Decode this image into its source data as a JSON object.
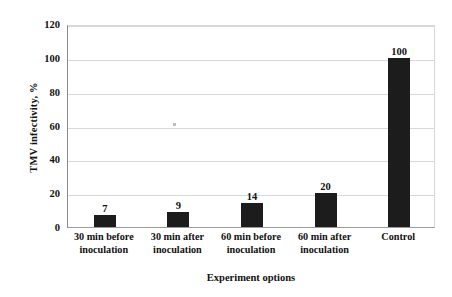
{
  "chart_data": {
    "type": "bar",
    "title": "",
    "subtitle": "",
    "xlabel": "Experiment options",
    "ylabel": "TMV infectivity, %",
    "categories": [
      "30 min before inoculation",
      "30 min after inoculation",
      "60 min before inoculation",
      "60 min after inoculation",
      "Control"
    ],
    "category_lines": [
      [
        "30 min before",
        "inoculation"
      ],
      [
        "30 min after",
        "inoculation"
      ],
      [
        "60 min before",
        "inoculation"
      ],
      [
        "60 min after",
        "inoculation"
      ],
      [
        "Control"
      ]
    ],
    "values": [
      7,
      9,
      14,
      20,
      100
    ],
    "data_labels": [
      "7",
      "9",
      "14",
      "20",
      "100"
    ],
    "ylim": [
      0,
      120
    ],
    "yticks": [
      0,
      20,
      40,
      60,
      80,
      100,
      120
    ],
    "ytick_labels": [
      "0",
      "20",
      "40",
      "60",
      "80",
      "100",
      "120"
    ],
    "grid": "horizontal",
    "legend": "none",
    "bar_color": "#1c1c1c",
    "gridline_color": "#d9d9d9",
    "axis_color": "#8a8a8a",
    "background_color": "#ffffff"
  }
}
